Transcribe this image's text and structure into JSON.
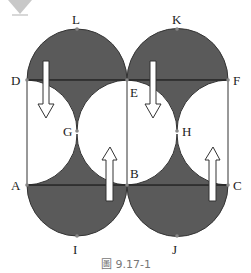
{
  "figure": {
    "caption": "圖 9.17-1",
    "colors": {
      "shade": "#5a5a5a",
      "line": "#333333",
      "point": "#888888",
      "arrow_fill": "#ffffff",
      "arrow_stroke": "#333333",
      "caption": "#777777",
      "marker": "#c8c8c8"
    },
    "points": {
      "L": "L",
      "K": "K",
      "D": "D",
      "E": "E",
      "F": "F",
      "G": "G",
      "H": "H",
      "A": "A",
      "B": "B",
      "C": "C",
      "I": "I",
      "J": "J"
    },
    "arrows": [
      {
        "position": "left-top",
        "direction": "down"
      },
      {
        "position": "left-bottom",
        "direction": "up"
      },
      {
        "position": "right-top",
        "direction": "down"
      },
      {
        "position": "right-bottom",
        "direction": "up"
      }
    ]
  }
}
